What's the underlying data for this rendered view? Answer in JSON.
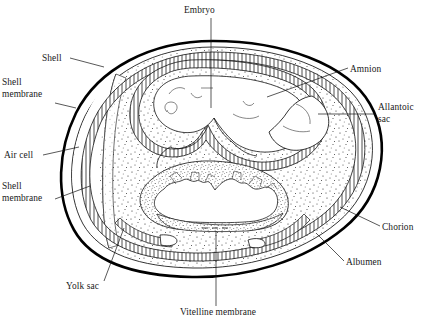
{
  "figure": {
    "background_color": "#ffffff",
    "ink_color": "#000000",
    "stipple_color": "#333333"
  },
  "labels": [
    {
      "key": "embryo",
      "text": "Embryo",
      "lines": [
        "Embryo"
      ],
      "x": 184,
      "y": 13,
      "anchor": "start",
      "leader": "M 211 18 L 211 108"
    },
    {
      "key": "shell",
      "text": "Shell",
      "lines": [
        "Shell"
      ],
      "x": 42,
      "y": 61,
      "anchor": "start",
      "leader": "M 70 58 L 104 67"
    },
    {
      "key": "shell_membrane_upper",
      "text": "Shell membrane",
      "lines": [
        "Shell",
        "membrane"
      ],
      "x": 2,
      "y": 85,
      "anchor": "start",
      "leader": "M 55 103 L 76 108"
    },
    {
      "key": "air_cell",
      "text": "Air cell",
      "lines": [
        "Air cell"
      ],
      "x": 4,
      "y": 158,
      "anchor": "start",
      "leader": "M 43 155 L 79 147"
    },
    {
      "key": "shell_membrane_lower",
      "text": "Shell membrane",
      "lines": [
        "Shell",
        "membrane"
      ],
      "x": 2,
      "y": 189,
      "anchor": "start",
      "leader": "M 55 199 L 90 186"
    },
    {
      "key": "yolk_sac",
      "text": "Yolk sac",
      "lines": [
        "Yolk sac"
      ],
      "x": 66,
      "y": 289,
      "anchor": "start",
      "leader": "M 104 281 L 124 228"
    },
    {
      "key": "vitelline_membrane",
      "text": "Vitelline membrane",
      "lines": [
        "Vitelline membrane"
      ],
      "x": 180,
      "y": 315,
      "anchor": "start",
      "leader": "M 216 306 L 216 231"
    },
    {
      "key": "amnion",
      "text": "Amnion",
      "lines": [
        "Amnion"
      ],
      "x": 350,
      "y": 72,
      "anchor": "start",
      "leader": "M 348 68 L 267 97"
    },
    {
      "key": "allantoic_sac",
      "text": "Allantoic sac",
      "lines": [
        "Allantoic",
        "sac"
      ],
      "x": 378,
      "y": 110,
      "anchor": "start",
      "leader": "M 376 114 L 318 114"
    },
    {
      "key": "chorion",
      "text": "Chorion",
      "lines": [
        "Chorion"
      ],
      "x": 382,
      "y": 230,
      "anchor": "start",
      "leader": "M 380 226 L 340 207"
    },
    {
      "key": "albumen",
      "text": "Albumen",
      "lines": [
        "Albumen"
      ],
      "x": 346,
      "y": 265,
      "anchor": "start",
      "leader": "M 344 261 L 316 233"
    }
  ],
  "structures": [
    {
      "key": "shell",
      "name": "egg-shell-outline"
    },
    {
      "key": "shell-membrane",
      "name": "shell-membrane-layer"
    },
    {
      "key": "air-cell",
      "name": "air-cell-region"
    },
    {
      "key": "albumen",
      "name": "albumen-region"
    },
    {
      "key": "chorion",
      "name": "chorion-membrane"
    },
    {
      "key": "allantoic-sac",
      "name": "allantoic-sac-region"
    },
    {
      "key": "amnion",
      "name": "amnion-membrane"
    },
    {
      "key": "embryo",
      "name": "embryo-body"
    },
    {
      "key": "yolk-sac",
      "name": "yolk-sac-region"
    },
    {
      "key": "vitelline-membrane",
      "name": "vitelline-membrane-line"
    }
  ]
}
